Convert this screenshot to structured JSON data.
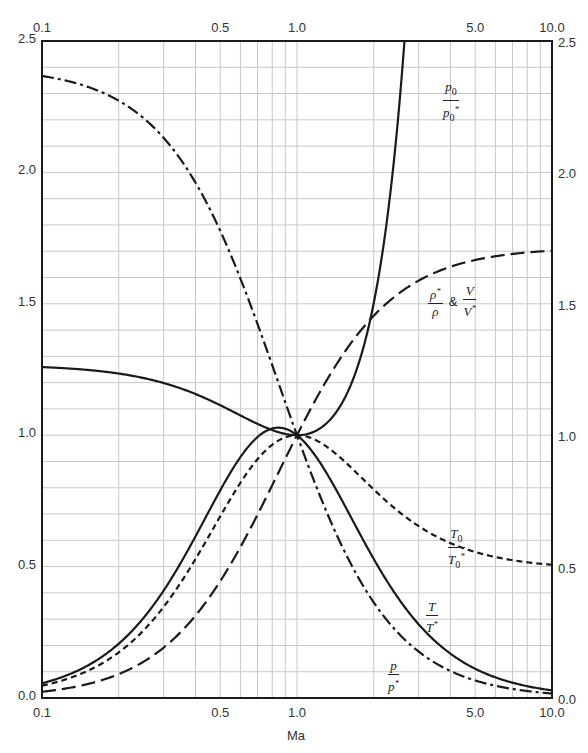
{
  "chart_data": {
    "type": "line",
    "title": "",
    "xlabel": "Ma",
    "ylabel": "",
    "x_scale": "log",
    "xlim": [
      0.1,
      10.0
    ],
    "ylim": [
      0.0,
      2.5
    ],
    "grid": true,
    "x_tick_labels": [
      "0.1",
      "0.5",
      "1.0",
      "5.0",
      "10.0"
    ],
    "x_ticks": [
      0.1,
      0.5,
      1.0,
      5.0,
      10.0
    ],
    "y_tick_labels": [
      "0.0",
      "0.5",
      "1.0",
      "1.5",
      "2.0",
      "2.5"
    ],
    "y_ticks": [
      0.0,
      0.5,
      1.0,
      1.5,
      2.0,
      2.5
    ],
    "gamma": 1.4,
    "series": [
      {
        "name": "p0/p0*",
        "function": "p0_ratio",
        "style": "solid",
        "label_num": "p",
        "label_num_sub": "0",
        "label_den": "p",
        "label_den_sub": "0",
        "label_den_sup": "*",
        "sample_points": [
          [
            0.1,
            1.259
          ],
          [
            0.5,
            1.114
          ],
          [
            1.0,
            1.0
          ],
          [
            2.0,
            1.503
          ],
          [
            2.5,
            2.222
          ]
        ]
      },
      {
        "name": "rho*/rho & V/V*",
        "function": "v_ratio",
        "style": "dashed",
        "label_text": "ρ*/ρ & V/V*",
        "sample_points": [
          [
            0.1,
            0.0237
          ],
          [
            0.5,
            0.444
          ],
          [
            1.0,
            1.0
          ],
          [
            2.0,
            1.455
          ],
          [
            5.0,
            1.641
          ],
          [
            10.0,
            1.695
          ]
        ]
      },
      {
        "name": "T0/T0*",
        "function": "t0_ratio",
        "style": "short-dashed",
        "label_num": "T",
        "label_num_sub": "0",
        "label_den": "T",
        "label_den_sub": "0",
        "label_den_sup": "*",
        "sample_points": [
          [
            0.1,
            0.0468
          ],
          [
            0.5,
            0.691
          ],
          [
            1.0,
            1.0
          ],
          [
            2.0,
            0.793
          ],
          [
            5.0,
            0.568
          ],
          [
            10.0,
            0.498
          ]
        ]
      },
      {
        "name": "T/T*",
        "function": "t_ratio",
        "style": "solid",
        "label_num": "T",
        "label_den": "T",
        "label_den_sup": "*",
        "sample_points": [
          [
            0.1,
            0.056
          ],
          [
            0.5,
            0.79
          ],
          [
            0.845,
            1.029
          ],
          [
            1.0,
            1.0
          ],
          [
            2.0,
            0.529
          ],
          [
            5.0,
            0.1298
          ],
          [
            10.0,
            0.0335
          ]
        ]
      },
      {
        "name": "p/p*",
        "function": "p_ratio",
        "style": "dash-dot",
        "label_num": "p",
        "label_den": "p",
        "label_den_sup": "*",
        "sample_points": [
          [
            0.1,
            2.367
          ],
          [
            0.5,
            1.778
          ],
          [
            1.0,
            1.0
          ],
          [
            2.0,
            0.364
          ],
          [
            5.0,
            0.069
          ],
          [
            10.0,
            0.0198
          ]
        ]
      }
    ]
  },
  "colors": {
    "curve": "#1a1a1a",
    "grid": "#c8c8c8",
    "frame": "#1a1a1a"
  }
}
